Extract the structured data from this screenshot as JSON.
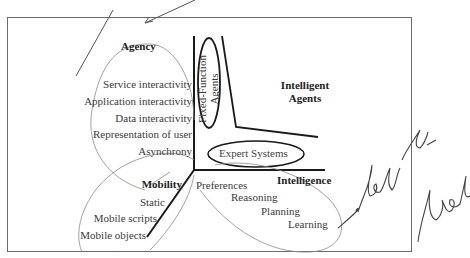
{
  "diagram": {
    "axes": {
      "agency": {
        "label": "Agency"
      },
      "intelligence": {
        "label": "Intelligence"
      },
      "mobility": {
        "label": "Mobility"
      }
    },
    "agency_items": [
      "Service interactivity",
      "Application interactivity",
      "Data interactivity",
      "Representation of user",
      "Asynchrony"
    ],
    "mobility_items": [
      "Static",
      "Mobile scripts",
      "Mobile objects"
    ],
    "intelligence_items": [
      "Preferences",
      "Reasoning",
      "Planning",
      "Learning"
    ],
    "regions": {
      "intelligent_agents": {
        "line1": "Intelligent",
        "line2": "Agents"
      },
      "fixed_function": {
        "line1": "Fixed-Function",
        "line2": "Agents"
      },
      "expert_systems": {
        "label": "Expert Systems"
      }
    },
    "annotation": {
      "handwritten": "look at levels"
    },
    "colors": {
      "frame": "#6b6b6b",
      "axis": "#1a1a1a",
      "pencil": "#8a8a8a",
      "ink": "#3a3a3a"
    }
  }
}
